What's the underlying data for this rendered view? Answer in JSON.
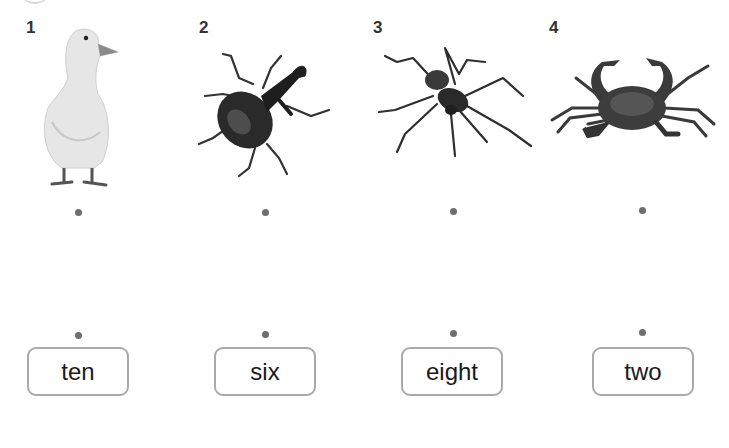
{
  "exercise": {
    "type": "matching",
    "items": [
      {
        "number": "1",
        "animal": "duck",
        "word": "ten"
      },
      {
        "number": "2",
        "animal": "beetle",
        "word": "six"
      },
      {
        "number": "3",
        "animal": "spider",
        "word": "eight"
      },
      {
        "number": "4",
        "animal": "crab",
        "word": "two"
      }
    ]
  },
  "colors": {
    "dot": "#6e6e6e",
    "box_border": "#a9a9a9",
    "text": "#1a1a1a"
  }
}
